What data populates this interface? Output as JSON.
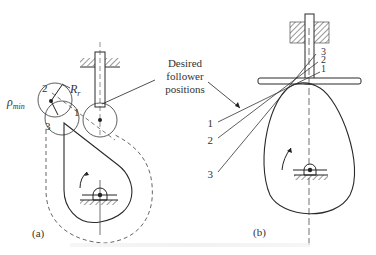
{
  "figure": {
    "panels": [
      {
        "id": "a",
        "label": "(a)",
        "follower_type": "roller",
        "annotations": {
          "rho_min": "ρ",
          "rho_min_sub": "min",
          "roller_radius": "R",
          "roller_radius_sub": "r",
          "positions": [
            "1",
            "2",
            "3"
          ]
        }
      },
      {
        "id": "b",
        "label": "(b)",
        "follower_type": "flat-faced",
        "annotations": {
          "positions_left": [
            "1",
            "2",
            "3"
          ],
          "positions_right": [
            "3",
            "2",
            "1"
          ]
        }
      }
    ],
    "callout": {
      "line1": "Desired",
      "line2": "follower",
      "line3": "positions"
    }
  },
  "colors": {
    "line": "#2a2a2a",
    "dashed": "#555555",
    "background": "#ffffff"
  }
}
